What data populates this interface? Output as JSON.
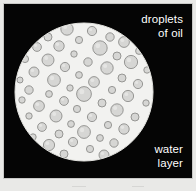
{
  "figure": {
    "background_color": "#050505",
    "frame_border_color": "#c9c9c7",
    "page_background_color": "#e9e9e7"
  },
  "labels": {
    "oil": "droplets\nof oil",
    "oil_lines": [
      "droplets",
      "of oil"
    ],
    "water": "water\nlayer",
    "water_lines": [
      "water",
      "layer"
    ],
    "text_color": "#ffffff"
  },
  "water_layer": {
    "name": "water-layer-circle",
    "fill_color": "#f2f2f0",
    "edge_color": "#e2e2de",
    "center_x": 80,
    "center_y": 88,
    "radius": 69
  },
  "oil_droplets": {
    "name": "oil-droplet",
    "fill_color": "#d6d6d4",
    "stroke_color": "#8d8d8b",
    "highlight_color": "#eaeae8",
    "count": 57,
    "items": [
      {
        "cx": 63,
        "cy": 25,
        "r": 6.2
      },
      {
        "cx": 88,
        "cy": 27,
        "r": 4.6
      },
      {
        "cx": 106,
        "cy": 33,
        "r": 4.2
      },
      {
        "cx": 44,
        "cy": 33,
        "r": 4.0
      },
      {
        "cx": 75,
        "cy": 36,
        "r": 3.6
      },
      {
        "cx": 120,
        "cy": 38,
        "r": 5.4
      },
      {
        "cx": 33,
        "cy": 43,
        "r": 4.4
      },
      {
        "cx": 55,
        "cy": 42,
        "r": 5.2
      },
      {
        "cx": 96,
        "cy": 44,
        "r": 7.2
      },
      {
        "cx": 135,
        "cy": 47,
        "r": 3.4
      },
      {
        "cx": 70,
        "cy": 50,
        "r": 3.2
      },
      {
        "cx": 113,
        "cy": 52,
        "r": 4.0
      },
      {
        "cx": 21,
        "cy": 55,
        "r": 3.6
      },
      {
        "cx": 44,
        "cy": 56,
        "r": 6.0
      },
      {
        "cx": 84,
        "cy": 58,
        "r": 4.2
      },
      {
        "cx": 127,
        "cy": 58,
        "r": 6.6
      },
      {
        "cx": 61,
        "cy": 63,
        "r": 4.6
      },
      {
        "cx": 103,
        "cy": 64,
        "r": 6.2
      },
      {
        "cx": 143,
        "cy": 66,
        "r": 3.2
      },
      {
        "cx": 30,
        "cy": 68,
        "r": 5.0
      },
      {
        "cx": 75,
        "cy": 71,
        "r": 3.4
      },
      {
        "cx": 118,
        "cy": 74,
        "r": 4.0
      },
      {
        "cx": 16,
        "cy": 76,
        "r": 3.0
      },
      {
        "cx": 50,
        "cy": 76,
        "r": 6.4
      },
      {
        "cx": 90,
        "cy": 78,
        "r": 5.4
      },
      {
        "cx": 134,
        "cy": 80,
        "r": 4.6
      },
      {
        "cx": 66,
        "cy": 84,
        "r": 3.2
      },
      {
        "cx": 25,
        "cy": 86,
        "r": 4.2
      },
      {
        "cx": 108,
        "cy": 86,
        "r": 3.6
      },
      {
        "cx": 45,
        "cy": 90,
        "r": 3.4
      },
      {
        "cx": 80,
        "cy": 90,
        "r": 7.4
      },
      {
        "cx": 124,
        "cy": 92,
        "r": 5.6
      },
      {
        "cx": 18,
        "cy": 96,
        "r": 3.2
      },
      {
        "cx": 60,
        "cy": 97,
        "r": 4.4
      },
      {
        "cx": 98,
        "cy": 99,
        "r": 4.0
      },
      {
        "cx": 142,
        "cy": 99,
        "r": 3.2
      },
      {
        "cx": 35,
        "cy": 102,
        "r": 5.4
      },
      {
        "cx": 73,
        "cy": 105,
        "r": 3.6
      },
      {
        "cx": 113,
        "cy": 106,
        "r": 6.2
      },
      {
        "cx": 25,
        "cy": 112,
        "r": 3.2
      },
      {
        "cx": 52,
        "cy": 112,
        "r": 6.0
      },
      {
        "cx": 88,
        "cy": 113,
        "r": 4.6
      },
      {
        "cx": 131,
        "cy": 113,
        "r": 4.0
      },
      {
        "cx": 67,
        "cy": 120,
        "r": 3.4
      },
      {
        "cx": 104,
        "cy": 121,
        "r": 3.6
      },
      {
        "cx": 38,
        "cy": 123,
        "r": 4.4
      },
      {
        "cx": 120,
        "cy": 125,
        "r": 5.2
      },
      {
        "cx": 80,
        "cy": 128,
        "r": 6.4
      },
      {
        "cx": 55,
        "cy": 130,
        "r": 4.0
      },
      {
        "cx": 96,
        "cy": 134,
        "r": 3.4
      },
      {
        "cx": 29,
        "cy": 133,
        "r": 3.2
      },
      {
        "cx": 69,
        "cy": 138,
        "r": 4.6
      },
      {
        "cx": 110,
        "cy": 139,
        "r": 4.2
      },
      {
        "cx": 45,
        "cy": 141,
        "r": 5.6
      },
      {
        "cx": 86,
        "cy": 145,
        "r": 3.6
      },
      {
        "cx": 60,
        "cy": 150,
        "r": 4.0
      },
      {
        "cx": 100,
        "cy": 151,
        "r": 5.0
      }
    ]
  }
}
